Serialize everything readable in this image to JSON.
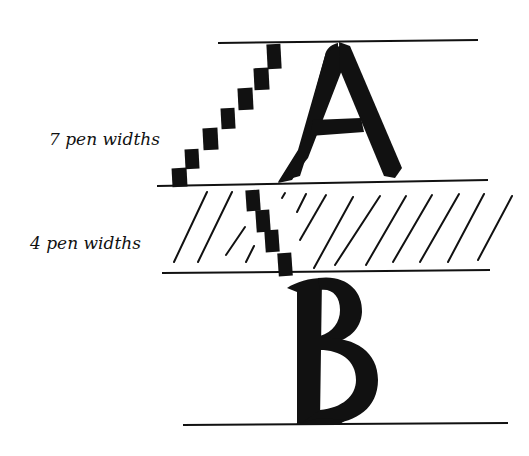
{
  "diagram": {
    "title": "",
    "labels": {
      "ascender_height": "7 pen widths",
      "x_height": "4 pen widths"
    },
    "letters": [
      "A",
      "B"
    ],
    "colors": {
      "ink": "#111111",
      "background": "#ffffff"
    },
    "guidelines_y": [
      42,
      182,
      272,
      424
    ],
    "pen_width_squares": {
      "upper_stack_count": 7,
      "lower_stack_count": 4
    }
  }
}
